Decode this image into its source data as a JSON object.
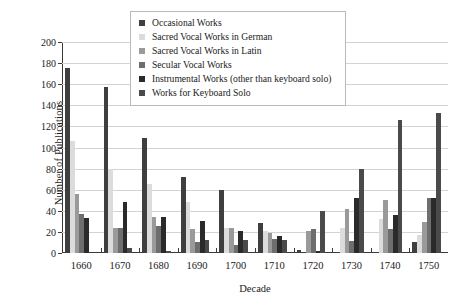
{
  "chart_data": {
    "type": "bar",
    "title": "",
    "xlabel": "Decade",
    "ylabel": "Number of Publications",
    "categories": [
      "1660",
      "1670",
      "1680",
      "1690",
      "1700",
      "1710",
      "1720",
      "1730",
      "1740",
      "1750"
    ],
    "ylim": [
      0,
      200
    ],
    "yticks": [
      0,
      20,
      40,
      60,
      80,
      100,
      120,
      140,
      160,
      180,
      200
    ],
    "grid": true,
    "legend_position": "top-center",
    "series": [
      {
        "name": "Occasional Works",
        "color": "#3f3f3f",
        "values": [
          175,
          157,
          109,
          72,
          60,
          28,
          3,
          1,
          1,
          10
        ]
      },
      {
        "name": "Sacred Vocal Works in German",
        "color": "#dcdcdc",
        "values": [
          106,
          80,
          65,
          48,
          24,
          21,
          0,
          24,
          32,
          17
        ]
      },
      {
        "name": "Sacred Vocal Works in Latin",
        "color": "#9a9a9a",
        "values": [
          56,
          24,
          34,
          23,
          24,
          19,
          21,
          42,
          50,
          29
        ]
      },
      {
        "name": "Secular Vocal Works",
        "color": "#6e6e6e",
        "values": [
          37,
          24,
          26,
          10,
          8,
          13,
          23,
          11,
          23,
          52
        ]
      },
      {
        "name": "Instrumental Works (other than keyboard solo)",
        "color": "#2a2a2a",
        "values": [
          33,
          48,
          34,
          30,
          21,
          16,
          2,
          52,
          36,
          52
        ]
      },
      {
        "name": "Works for Keyboard Solo",
        "color": "#4a4a4a",
        "values": [
          0,
          5,
          2,
          12,
          12,
          12,
          40,
          80,
          126,
          133
        ]
      }
    ]
  }
}
